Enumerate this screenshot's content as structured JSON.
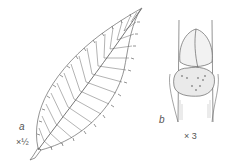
{
  "figure": {
    "panel_a": {
      "label": "a",
      "scale": "×½",
      "subject": "serrated leaf"
    },
    "panel_b": {
      "label": "b",
      "scale": "× 3",
      "subject": "bud and leaf scar on twig"
    }
  },
  "colors": {
    "line": "#555555",
    "shade": "#999999",
    "background": "#ffffff"
  }
}
